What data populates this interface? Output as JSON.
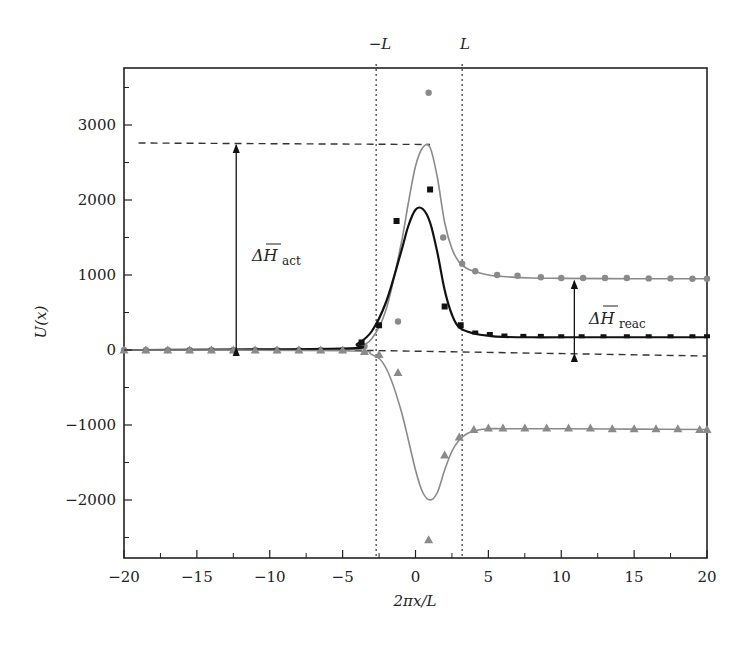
{
  "chart_data": {
    "type": "line",
    "title": "",
    "xlabel": "2πx/L",
    "ylabel": "U(x)",
    "xlim": [
      -20,
      20
    ],
    "ylim": [
      -2700,
      3700
    ],
    "x_ticks": [
      -20,
      -15,
      -10,
      -5,
      0,
      5,
      10,
      15,
      20
    ],
    "x_tick_labels": [
      "−20",
      "−15",
      "−10",
      "−5",
      "0",
      "5",
      "10",
      "15",
      "20"
    ],
    "y_ticks": [
      -2000,
      -1000,
      0,
      1000,
      2000,
      3000
    ],
    "y_tick_labels": [
      "−2000",
      "−1000",
      "0",
      "1000",
      "2000",
      "3000"
    ],
    "grid": false,
    "legend": null,
    "vertical_markers": [
      {
        "label": "−L",
        "x": -2.7,
        "style": "dotted"
      },
      {
        "label": "L",
        "x": 3.2,
        "style": "dotted"
      }
    ],
    "annotations": [
      {
        "text": "ΔH̄act",
        "main": "ΔH",
        "sub": "act",
        "type": "double-arrow",
        "x": -12.3,
        "y_from": 0,
        "y_to": 2760
      },
      {
        "text": "ΔH̄reac",
        "main": "ΔH",
        "sub": "reac",
        "type": "double-arrow",
        "x": 10.9,
        "y_from": -80,
        "y_to": 950
      }
    ],
    "reference_lines": [
      {
        "name": "activation level",
        "style": "dashed",
        "x": [
          -19,
          1
        ],
        "y": [
          2760,
          2740
        ]
      },
      {
        "name": "zero baseline",
        "style": "dashed",
        "x": [
          -5,
          20
        ],
        "y": [
          0,
          -80
        ]
      }
    ],
    "series": [
      {
        "name": "gray curve (upper)",
        "color": "#8a8a8a",
        "marker": "circle",
        "curve": {
          "x": [
            -20,
            -5,
            -4,
            -3,
            -2,
            -1,
            -0.5,
            0,
            0.5,
            1,
            1.5,
            2,
            2.5,
            3,
            3.5,
            4,
            5,
            6,
            8,
            10,
            15,
            20
          ],
          "y": [
            0,
            10,
            40,
            150,
            550,
            1400,
            1950,
            2450,
            2700,
            2700,
            2300,
            1700,
            1350,
            1170,
            1090,
            1050,
            1000,
            980,
            960,
            955,
            950,
            950
          ]
        },
        "points": {
          "x": [
            -20,
            -18.5,
            -17,
            -15.5,
            -14,
            -12.5,
            -11,
            -9.5,
            -8,
            -6.5,
            -5,
            -3.5,
            -1.2,
            0.9,
            1.9,
            3.2,
            4.1,
            5.6,
            7,
            8.6,
            10,
            11.5,
            13,
            14.5,
            16,
            17.5,
            19,
            20
          ],
          "y": [
            0,
            0,
            0,
            0,
            0,
            0,
            0,
            0,
            0,
            0,
            0,
            50,
            380,
            3430,
            1500,
            1150,
            1050,
            1000,
            990,
            970,
            960,
            960,
            960,
            960,
            955,
            955,
            950,
            950
          ]
        }
      },
      {
        "name": "black curve (middle)",
        "color": "#111111",
        "marker": "square",
        "curve": {
          "x": [
            -20,
            -5,
            -4,
            -3,
            -2,
            -1,
            -0.5,
            0,
            0.5,
            1,
            1.5,
            2,
            2.5,
            3,
            4,
            5,
            6,
            8,
            10,
            15,
            20
          ],
          "y": [
            0,
            20,
            80,
            250,
            650,
            1300,
            1650,
            1870,
            1880,
            1700,
            1300,
            800,
            470,
            300,
            220,
            190,
            175,
            170,
            170,
            170,
            170
          ]
        },
        "points": {
          "x": [
            -3.7,
            -2.5,
            -1.3,
            1,
            2,
            3.1,
            4.1,
            5.1,
            6.1,
            7.4,
            8.6,
            10,
            11.4,
            12.9,
            14.5,
            16,
            17.5,
            19,
            20
          ],
          "y": [
            100,
            330,
            1720,
            2140,
            580,
            330,
            220,
            200,
            180,
            175,
            175,
            170,
            170,
            170,
            170,
            170,
            170,
            170,
            170
          ]
        }
      },
      {
        "name": "gray curve (lower)",
        "color": "#8a8a8a",
        "marker": "triangle",
        "curve": {
          "x": [
            -20,
            -5,
            -3,
            -2,
            -1,
            0,
            0.5,
            1,
            1.5,
            2,
            2.5,
            3,
            3.5,
            4,
            5,
            6,
            8,
            10,
            15,
            20
          ],
          "y": [
            0,
            -10,
            -60,
            -250,
            -800,
            -1600,
            -1900,
            -2000,
            -1900,
            -1600,
            -1350,
            -1200,
            -1120,
            -1080,
            -1050,
            -1050,
            -1050,
            -1050,
            -1055,
            -1060
          ]
        },
        "points": {
          "x": [
            -20,
            -18.5,
            -17,
            -15.5,
            -14,
            -12.5,
            -11,
            -9.5,
            -8,
            -6.5,
            -5,
            -3.5,
            -2.5,
            -1.2,
            0.9,
            2,
            3,
            4,
            5,
            6,
            7.5,
            9,
            10.5,
            12,
            13.5,
            15,
            16.5,
            18,
            19.5,
            20
          ],
          "y": [
            0,
            0,
            0,
            0,
            0,
            0,
            0,
            0,
            0,
            0,
            0,
            -20,
            -60,
            -300,
            -2530,
            -1400,
            -1160,
            -1060,
            -1040,
            -1040,
            -1040,
            -1040,
            -1040,
            -1040,
            -1050,
            -1050,
            -1050,
            -1050,
            -1060,
            -1060
          ]
        }
      }
    ]
  },
  "labels": {
    "x_axis": "2πx/L",
    "y_axis": "U(x)",
    "minus_L": "−L",
    "plus_L": "L",
    "dh_act_main": "ΔH",
    "dh_act_sub": "act",
    "dh_reac_main": "ΔH",
    "dh_reac_sub": "reac"
  }
}
